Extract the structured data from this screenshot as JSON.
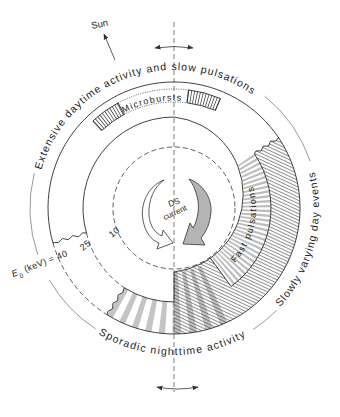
{
  "figure": {
    "sun": {
      "label": "Sun"
    },
    "labels": {
      "daytime": "Extensive daytime activity and slow pulsations",
      "day_events": "Slowly varying day events",
      "nighttime": "Sporadic nighttime activity",
      "microbursts": "Microbursts",
      "fast_pulsations": "Fast pulsations"
    },
    "center": {
      "line1": "DS",
      "line2": "current"
    },
    "energy": {
      "symbol": "E",
      "subscript": "0",
      "unit_text": " (keV) = ",
      "contours": [
        {
          "value": "40"
        },
        {
          "value": "25"
        },
        {
          "value": "10"
        }
      ]
    }
  },
  "colors": {
    "line": "#2b2b2b",
    "gray_arrow": "#b4b4b4",
    "stripe": "#c4c4c4",
    "background": "#ffffff"
  }
}
